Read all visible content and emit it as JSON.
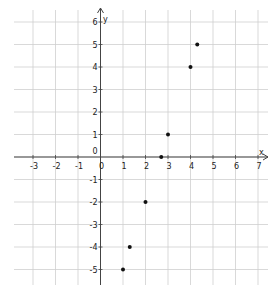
{
  "chart_data": {
    "type": "scatter",
    "title": "",
    "xlabel": "x",
    "ylabel": "y",
    "xlim": [
      -3.8,
      7.5
    ],
    "ylim": [
      -5.7,
      6.5
    ],
    "grid": true,
    "x_ticks": [
      -3,
      -2,
      -1,
      0,
      1,
      2,
      3,
      4,
      5,
      6,
      7
    ],
    "y_ticks": [
      -5,
      -4,
      -3,
      -2,
      -1,
      0,
      1,
      2,
      3,
      4,
      5,
      6
    ],
    "origin_label": "0",
    "points": [
      {
        "x": 1,
        "y": -5
      },
      {
        "x": 1.3,
        "y": -4
      },
      {
        "x": 2,
        "y": -2
      },
      {
        "x": 2.7,
        "y": 0
      },
      {
        "x": 3,
        "y": 1
      },
      {
        "x": 4,
        "y": 4
      },
      {
        "x": 4.3,
        "y": 5
      }
    ]
  },
  "pixel_map": {
    "x0": 100.5,
    "y0": 157,
    "unit": 22.5
  }
}
